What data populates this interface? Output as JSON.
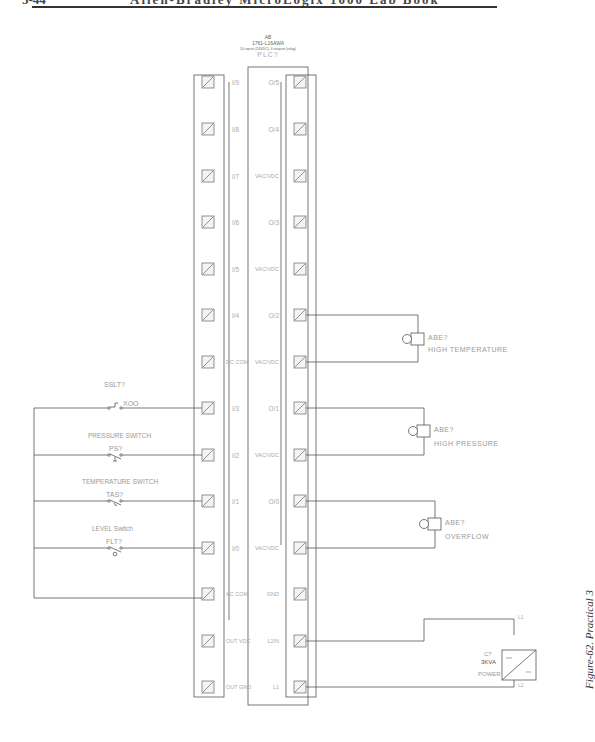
{
  "header": {
    "page_number": "5-44",
    "title": "Allen-Bradley MicroLogix 1000 Lab Book",
    "rule_color": "#333333"
  },
  "plc": {
    "manufacturer": "AB",
    "model": "1761-L16AWA",
    "description": "10 inputs (24VDC), 6 outputs (relay)",
    "tag": "PLC?",
    "left_terminals": [
      "I/9",
      "I/8",
      "I/7",
      "I/6",
      "I/5",
      "I/4",
      "DC COM",
      "I/3",
      "I/2",
      "I/1",
      "I/0",
      "AC COM",
      "OUT VDC",
      "OUT GND"
    ],
    "right_terminals": [
      "O/5",
      "O/4",
      "VAC/VDC",
      "O/3",
      "VAC/VDC",
      "O/2",
      "VAC/VDC",
      "O/1",
      "VAC/VDC",
      "O/0",
      "VAC/VDC",
      "GND",
      "L2/N",
      "L1"
    ]
  },
  "inputs": [
    {
      "name": "SELECTOR SWITCH",
      "tag": "SSLT?",
      "contact": "XOO",
      "terminal": "I/3"
    },
    {
      "name": "PRESSURE SWITCH",
      "tag": "PS?",
      "terminal": "I/2"
    },
    {
      "name": "TEMPERATURE SWITCH",
      "tag": "TAS?",
      "terminal": "I/1"
    },
    {
      "name": "LEVEL Switch",
      "tag": "FLT?",
      "terminal": "I/0"
    }
  ],
  "outputs": [
    {
      "tag": "ABE?",
      "name": "HIGH TEMPERATURE",
      "terminal": "O/2"
    },
    {
      "tag": "ABE?",
      "name": "HIGH PRESSURE",
      "terminal": "O/1"
    },
    {
      "tag": "ABE?",
      "name": "OVERFLOW",
      "terminal": "O/0"
    }
  ],
  "power_supply": {
    "tag": "C?",
    "rating": "3KVA",
    "label": "POWER",
    "terminal_top": "L1",
    "terminal_bottom": "L2"
  },
  "caption": "Figure-62. Practical 3"
}
